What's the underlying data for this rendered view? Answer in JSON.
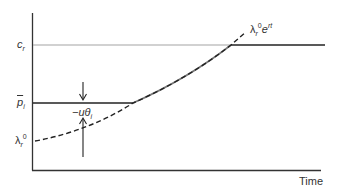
{
  "diagram": {
    "type": "price path diagram",
    "x_axis_label": "Time",
    "y_axis_ticks": {
      "c_r": {
        "base": "c",
        "sub": "r"
      },
      "p_bar_i": {
        "base": "p",
        "sub": "i",
        "overline": true
      },
      "lambda_r0": {
        "base": "λ",
        "sub": "r",
        "sup": "0"
      }
    },
    "curve_label": {
      "base": "λ",
      "sub": "r",
      "sup": "0",
      "tail": "e",
      "tail_sup": "rt"
    },
    "gap_label": {
      "prefix": "−u",
      "theta": "θ",
      "sub": "i"
    },
    "colors": {
      "axis": "#333333",
      "thin_line": "#999999",
      "thick_line": "#222222",
      "curve": "#222222"
    }
  }
}
